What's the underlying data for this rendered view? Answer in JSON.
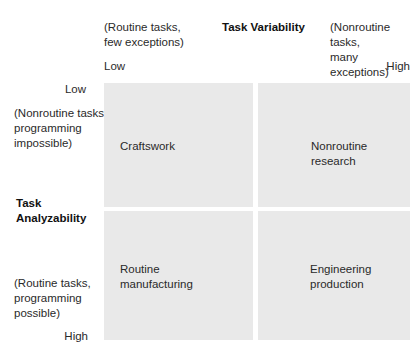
{
  "diagram": {
    "x_axis": {
      "title": "Task Variability",
      "left_desc": [
        "(Routine tasks,",
        "few exceptions)"
      ],
      "right_desc": [
        "(Nonroutine tasks,",
        "many exceptions)"
      ],
      "low_label": "Low",
      "high_label": "High"
    },
    "y_axis": {
      "title": [
        "Task",
        "Analyzability"
      ],
      "top_desc": [
        "(Nonroutine tasks,",
        "programming",
        "impossible)"
      ],
      "bottom_desc": [
        "(Routine tasks,",
        "programming",
        "possible)"
      ],
      "low_label": "Low",
      "high_label": "High"
    },
    "quadrants": {
      "top_left": [
        "Craftswork"
      ],
      "top_right": [
        "Nonroutine",
        "research"
      ],
      "bottom_left": [
        "Routine",
        "manufacturing"
      ],
      "bottom_right": [
        "Engineering",
        "production"
      ]
    },
    "colors": {
      "quadrant_fill": "#e9e9e9",
      "background": "#ffffff",
      "text": "#2a2a2a"
    }
  }
}
